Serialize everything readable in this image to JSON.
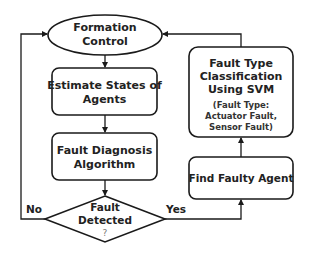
{
  "diagram": {
    "nodes": {
      "formation_control": {
        "shape": "ellipse",
        "lines": [
          "Formation",
          "Control"
        ]
      },
      "estimate_states": {
        "shape": "rounded-rect",
        "lines": [
          "Estimate States of",
          "Agents"
        ]
      },
      "fault_diagnosis": {
        "shape": "rounded-rect",
        "lines": [
          "Fault Diagnosis",
          "Algorithm"
        ]
      },
      "fault_detected": {
        "shape": "diamond",
        "lines": [
          "Fault",
          "Detected",
          "?"
        ]
      },
      "find_faulty_agent": {
        "shape": "rounded-rect",
        "lines": [
          "Find Faulty Agent"
        ]
      },
      "fault_classification": {
        "shape": "rounded-rect",
        "lines": [
          "Fault Type",
          "Classification",
          "Using SVM"
        ],
        "sub_lines": [
          "(Fault Type:",
          "Actuator Fault,",
          "Sensor Fault)"
        ]
      }
    },
    "edge_labels": {
      "no": "No",
      "yes": "Yes"
    },
    "edges": [
      {
        "from": "formation_control",
        "to": "estimate_states"
      },
      {
        "from": "estimate_states",
        "to": "fault_diagnosis"
      },
      {
        "from": "fault_diagnosis",
        "to": "fault_detected"
      },
      {
        "from": "fault_detected",
        "to": "formation_control",
        "label": "No"
      },
      {
        "from": "fault_detected",
        "to": "find_faulty_agent",
        "label": "Yes"
      },
      {
        "from": "find_faulty_agent",
        "to": "fault_classification"
      },
      {
        "from": "fault_classification",
        "to": "formation_control"
      }
    ],
    "colors": {
      "stroke": "#1a1a1a",
      "text": "#222222",
      "background": "#ffffff"
    }
  }
}
